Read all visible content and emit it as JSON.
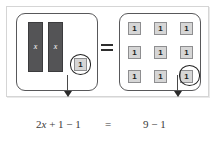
{
  "diagram": {
    "colors": {
      "x_bar_fill": "#545456",
      "x_bar_border": "#3c3c3e",
      "unit_tile_fill": "#d6d6d6",
      "unit_tile_border": "#8e8e90",
      "panel_border": "#58585a",
      "card_border": "#d5d5d5",
      "ring_stroke": "#212121",
      "arrow_color": "#2b2b2b",
      "text_color": "#3a3a3a",
      "background": "#ffffff"
    },
    "left_panel": {
      "name": "left-expression-panel",
      "x_bars": [
        {
          "label": "x"
        },
        {
          "label": "x"
        }
      ],
      "unit_tile": {
        "label": "1",
        "circled": true
      }
    },
    "operator": {
      "symbol": "=",
      "icon": "equals-icon"
    },
    "right_panel": {
      "name": "right-expression-panel",
      "tiles": [
        {
          "label": "1",
          "circled": false
        },
        {
          "label": "1",
          "circled": false
        },
        {
          "label": "1",
          "circled": false
        },
        {
          "label": "1",
          "circled": false
        },
        {
          "label": "1",
          "circled": false
        },
        {
          "label": "1",
          "circled": false
        },
        {
          "label": "1",
          "circled": false
        },
        {
          "label": "1",
          "circled": false
        },
        {
          "label": "1",
          "circled": true
        }
      ],
      "rows": 3,
      "columns": 3
    },
    "arrows": [
      {
        "name": "left-removal-arrow",
        "direction": "down"
      },
      {
        "name": "right-removal-arrow",
        "direction": "down"
      }
    ],
    "equation": {
      "left_side": "2x + 1 − 1",
      "left_coefficient": "2",
      "left_variable": "x",
      "left_rest": " + 1 − 1",
      "equals": "=",
      "right_side": "9 − 1"
    }
  }
}
